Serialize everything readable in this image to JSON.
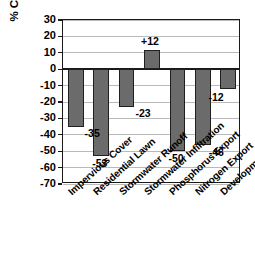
{
  "chart_data": {
    "type": "bar",
    "title": "",
    "xlabel": "",
    "ylabel": "% Change in Site Indicators",
    "ylim": [
      -70,
      30
    ],
    "yticks": [
      30,
      20,
      10,
      0,
      -10,
      -20,
      -30,
      -40,
      -50,
      -60,
      -70
    ],
    "ytick_labels": [
      "30",
      "20",
      "10",
      "0",
      "-10",
      "-20",
      "-30",
      "-40",
      "-50",
      "-60",
      "-70"
    ],
    "grid": true,
    "legend": "none",
    "bar_color": "#6b6b6b",
    "bar_edge_color": "#1f1f1f",
    "axis_color": "#1a1a1a",
    "gridline_color": "#b9b9b9",
    "categories": [
      "Impervious Cover",
      "Residential Lawn",
      "Stormwater Runoff",
      "Stormwater Infiltration",
      "Phosphorus Export",
      "Nitrogen Export",
      "Development Cost"
    ],
    "values": [
      -35,
      -53,
      -23,
      12,
      -50,
      -46,
      -12
    ],
    "data_labels": [
      "-35",
      "-53",
      "-23",
      "+12",
      "-50",
      "-46",
      "-12"
    ]
  }
}
